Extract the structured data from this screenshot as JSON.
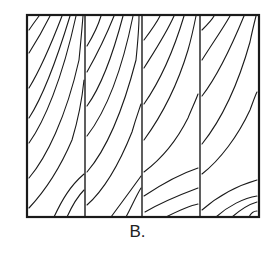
{
  "figure": {
    "caption": "B.",
    "panel_count": 4,
    "colors": {
      "line": "#1a1a1a",
      "background": "#ffffff"
    },
    "frame": {
      "x": 27,
      "y": 15,
      "width": 232,
      "height": 202
    },
    "dividers_x": [
      85,
      142,
      200
    ],
    "panels": [
      {
        "label": "board-1",
        "x0": 27,
        "x1": 85
      },
      {
        "label": "board-2",
        "x0": 85,
        "x1": 142
      },
      {
        "label": "board-3",
        "x0": 142,
        "x1": 200
      },
      {
        "label": "board-4",
        "x0": 200,
        "x1": 259
      }
    ],
    "grain_lines": [
      "M29,30 C33,24 36,20 39,16",
      "M29,53 C36,42 44,28 50,16",
      "M29,88 C40,70 52,42 62,16",
      "M29,118 C42,98 56,62 70,16",
      "M29,143 C44,122 62,80 76,16",
      "M29,178 C46,158 66,118 79,60 C81,40 82,28 83,16",
      "M29,208 C44,192 60,168 72,140 C78,120 82,100 84,80",
      "M54,217 C62,200 70,186 84,174",
      "M67,217 C72,206 78,196 84,190",
      "M87,46 C93,36 98,26 101,16",
      "M87,72 C96,56 106,36 114,16",
      "M87,106 C100,88 112,58 123,16",
      "M87,136 C104,114 120,80 133,16",
      "M87,172 C106,150 122,114 136,60 C138,40 139,28 139,16",
      "M87,205 C104,190 120,162 132,132 C136,118 139,110 141,104",
      "M111,217 C122,202 134,186 141,176",
      "M126,217 C132,206 136,196 141,188",
      "M144,40 C150,32 156,24 160,16",
      "M144,68 C154,52 166,34 174,16",
      "M144,104 C158,84 172,56 184,16",
      "M144,140 C160,118 176,90 188,50 C192,36 194,26 196,16",
      "M144,172 C160,160 176,142 188,118 C192,108 196,100 198,94",
      "M144,196 C162,184 180,174 198,168",
      "M145,212 C162,202 182,194 198,188",
      "M166,217 C176,212 188,206 198,204",
      "M202,30 C208,24 212,20 214,16",
      "M202,60 C212,44 222,30 230,16",
      "M202,96 C216,78 230,50 244,16",
      "M202,144 C218,124 236,92 250,42 C252,32 254,24 256,16",
      "M202,174 C220,160 238,136 250,110 C253,102 255,96 257,92",
      "M202,210 C218,196 236,186 257,180",
      "M216,217 C228,206 244,198 257,196",
      "M232,217 C240,210 250,204 257,202",
      "M249,217 C251,213 254,211 257,211"
    ]
  }
}
